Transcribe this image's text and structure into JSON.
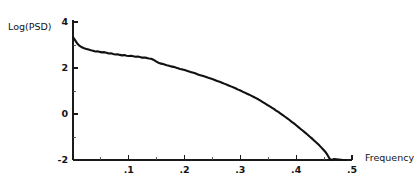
{
  "chart_data": {
    "type": "line",
    "title": "",
    "xlabel": "Frequency",
    "ylabel": "Log(PSD)",
    "xlim": [
      0.0,
      0.5
    ],
    "ylim": [
      -2,
      4
    ],
    "grid": false,
    "legend": "none",
    "xticks": [
      {
        "value": 0.1,
        "label": ".1"
      },
      {
        "value": 0.2,
        "label": ".2"
      },
      {
        "value": 0.3,
        "label": ".3"
      },
      {
        "value": 0.4,
        "label": ".4"
      },
      {
        "value": 0.5,
        "label": ".5"
      }
    ],
    "xminor_ticks": [
      0.05,
      0.15,
      0.25,
      0.35,
      0.45
    ],
    "yticks": [
      {
        "value": 4,
        "label": "4"
      },
      {
        "value": 2,
        "label": "2"
      },
      {
        "value": 0,
        "label": "0"
      },
      {
        "value": -2,
        "label": "-2"
      }
    ],
    "yminor_ticks": [
      3,
      1,
      -1
    ],
    "series": [
      {
        "name": "Log(PSD)",
        "color": "#111111",
        "x": [
          0.0,
          0.004,
          0.008,
          0.012,
          0.016,
          0.02,
          0.024,
          0.028,
          0.032,
          0.036,
          0.04,
          0.044,
          0.048,
          0.052,
          0.056,
          0.06,
          0.064,
          0.068,
          0.072,
          0.076,
          0.08,
          0.084,
          0.088,
          0.092,
          0.096,
          0.1,
          0.104,
          0.108,
          0.112,
          0.116,
          0.12,
          0.124,
          0.128,
          0.132,
          0.136,
          0.14,
          0.144,
          0.148,
          0.152,
          0.156,
          0.16,
          0.164,
          0.168,
          0.172,
          0.176,
          0.18,
          0.184,
          0.188,
          0.192,
          0.196,
          0.2,
          0.204,
          0.208,
          0.212,
          0.216,
          0.22,
          0.224,
          0.228,
          0.232,
          0.236,
          0.24,
          0.244,
          0.248,
          0.252,
          0.256,
          0.26,
          0.264,
          0.268,
          0.272,
          0.276,
          0.28,
          0.284,
          0.288,
          0.292,
          0.296,
          0.3,
          0.304,
          0.308,
          0.312,
          0.316,
          0.32,
          0.324,
          0.328,
          0.332,
          0.336,
          0.34,
          0.344,
          0.348,
          0.352,
          0.356,
          0.36,
          0.364,
          0.368,
          0.372,
          0.376,
          0.38,
          0.384,
          0.388,
          0.392,
          0.396,
          0.4,
          0.404,
          0.408,
          0.412,
          0.416,
          0.42,
          0.424,
          0.428,
          0.432,
          0.436,
          0.44,
          0.444,
          0.448,
          0.452,
          0.456,
          0.46,
          0.464,
          0.468,
          0.472,
          0.476,
          0.48,
          0.484,
          0.488
        ],
        "y": [
          3.35,
          3.2,
          3.05,
          2.96,
          2.9,
          2.86,
          2.83,
          2.8,
          2.77,
          2.75,
          2.72,
          2.73,
          2.7,
          2.68,
          2.69,
          2.66,
          2.63,
          2.64,
          2.61,
          2.59,
          2.6,
          2.57,
          2.55,
          2.56,
          2.53,
          2.52,
          2.53,
          2.51,
          2.49,
          2.5,
          2.48,
          2.45,
          2.46,
          2.44,
          2.41,
          2.4,
          2.36,
          2.3,
          2.24,
          2.2,
          2.18,
          2.15,
          2.12,
          2.1,
          2.07,
          2.05,
          2.02,
          1.99,
          1.96,
          1.94,
          1.91,
          1.88,
          1.85,
          1.82,
          1.79,
          1.76,
          1.72,
          1.69,
          1.66,
          1.63,
          1.6,
          1.56,
          1.53,
          1.5,
          1.46,
          1.42,
          1.39,
          1.35,
          1.31,
          1.27,
          1.23,
          1.19,
          1.15,
          1.11,
          1.06,
          1.02,
          0.97,
          0.93,
          0.88,
          0.84,
          0.79,
          0.74,
          0.69,
          0.64,
          0.58,
          0.52,
          0.46,
          0.4,
          0.34,
          0.28,
          0.22,
          0.15,
          0.09,
          0.02,
          -0.05,
          -0.12,
          -0.19,
          -0.26,
          -0.34,
          -0.41,
          -0.49,
          -0.57,
          -0.65,
          -0.73,
          -0.81,
          -0.89,
          -0.98,
          -1.06,
          -1.15,
          -1.24,
          -1.33,
          -1.43,
          -1.53,
          -1.64,
          -1.78,
          -1.95,
          -2.0,
          -1.96,
          -1.97,
          -1.98,
          -1.99,
          -2.0,
          -2.0
        ]
      }
    ]
  },
  "labels": {
    "y_axis_title": "Log(PSD)",
    "x_axis_title": "Frequency"
  }
}
